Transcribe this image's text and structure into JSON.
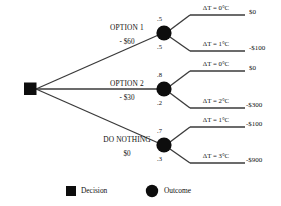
{
  "diagram": {
    "root": {
      "type": "decision",
      "shape": "square"
    },
    "branches": [
      {
        "name": "OPTION 1",
        "cost": "- $60",
        "node_type": "outcome",
        "outcomes": [
          {
            "prob": ".5",
            "delta": "ΔT = 0°C",
            "payoff": "$0"
          },
          {
            "prob": ".5",
            "delta": "ΔT = 1°C",
            "payoff": "-$100"
          }
        ]
      },
      {
        "name": "OPTION 2",
        "cost": "- $30",
        "node_type": "outcome",
        "outcomes": [
          {
            "prob": ".8",
            "delta": "ΔT = 0°C",
            "payoff": "$0"
          },
          {
            "prob": ".2",
            "delta": "ΔT = 2°C",
            "payoff": "-$300"
          }
        ]
      },
      {
        "name": "DO NOTHING",
        "cost": "$0",
        "node_type": "outcome",
        "outcomes": [
          {
            "prob": ".7",
            "delta": "ΔT = 1°C",
            "payoff": "-$100"
          },
          {
            "prob": ".3",
            "delta": "ΔT = 3°C",
            "payoff": "-$900"
          }
        ]
      }
    ]
  },
  "legend": {
    "items": [
      {
        "label": "Decision",
        "shape": "square",
        "icon": "square-node-icon"
      },
      {
        "label": "Outcome",
        "shape": "circle",
        "icon": "circle-node-icon"
      }
    ]
  },
  "colors": {
    "node": "#0d0d0d",
    "line": "#3a3a3a",
    "text": "#111111",
    "background": "#ffffff"
  }
}
